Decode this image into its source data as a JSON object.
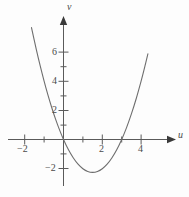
{
  "chart_data": {
    "type": "line",
    "title": "",
    "subtitle": "",
    "xlabel": "u",
    "ylabel": "v",
    "grid": false,
    "legend": null,
    "xlim": [
      -2.6,
      5.2
    ],
    "ylim": [
      -3.2,
      7.4
    ],
    "x_ticks_major": [
      -2,
      2,
      4
    ],
    "x_tick_labels": [
      "−2",
      "2",
      "4"
    ],
    "x_ticks_minor": [
      -1,
      1,
      3
    ],
    "y_ticks_major": [
      2,
      4,
      6,
      -2
    ],
    "y_tick_labels": [
      "2",
      "4",
      "6",
      "−2"
    ],
    "y_ticks_minor": [
      1,
      3,
      5,
      -1
    ],
    "curve": {
      "name": "parabola",
      "equation": "v = u^2 - 3u",
      "color": "#6e6e6e",
      "line_width": 1.1,
      "vertex": {
        "u": 1.5,
        "v": -2.25
      },
      "roots": [
        0,
        3
      ],
      "u_start": -1.65,
      "u_end": 4.35,
      "points": [
        {
          "u": -1.65,
          "v": 7.67
        },
        {
          "u": -1.4,
          "v": 6.16
        },
        {
          "u": -1.2,
          "v": 5.04
        },
        {
          "u": -1.0,
          "v": 4.0
        },
        {
          "u": -0.8,
          "v": 3.04
        },
        {
          "u": -0.6,
          "v": 2.16
        },
        {
          "u": -0.4,
          "v": 1.36
        },
        {
          "u": -0.2,
          "v": 0.64
        },
        {
          "u": 0.0,
          "v": 0.0
        },
        {
          "u": 0.25,
          "v": -0.69
        },
        {
          "u": 0.5,
          "v": -1.25
        },
        {
          "u": 0.75,
          "v": -1.69
        },
        {
          "u": 1.0,
          "v": -2.0
        },
        {
          "u": 1.25,
          "v": -2.19
        },
        {
          "u": 1.5,
          "v": -2.25
        },
        {
          "u": 1.75,
          "v": -2.19
        },
        {
          "u": 2.0,
          "v": -2.0
        },
        {
          "u": 2.25,
          "v": -1.69
        },
        {
          "u": 2.5,
          "v": -1.25
        },
        {
          "u": 2.75,
          "v": -0.69
        },
        {
          "u": 3.0,
          "v": 0.0
        },
        {
          "u": 3.25,
          "v": 0.81
        },
        {
          "u": 3.5,
          "v": 1.75
        },
        {
          "u": 3.75,
          "v": 2.81
        },
        {
          "u": 4.0,
          "v": 4.0
        },
        {
          "u": 4.2,
          "v": 5.04
        },
        {
          "u": 4.35,
          "v": 5.87
        }
      ]
    },
    "axes": {
      "color": "#5a5a5a",
      "line_width": 1.0,
      "x_axis_arrow": true,
      "y_axis_arrow": true
    }
  },
  "labels": {
    "x_axis_name": "u",
    "y_axis_name": "v",
    "x_neg2": "−2",
    "x_2": "2",
    "x_4": "4",
    "y_2": "2",
    "y_4": "4",
    "y_6": "6",
    "y_neg2": "−2"
  }
}
